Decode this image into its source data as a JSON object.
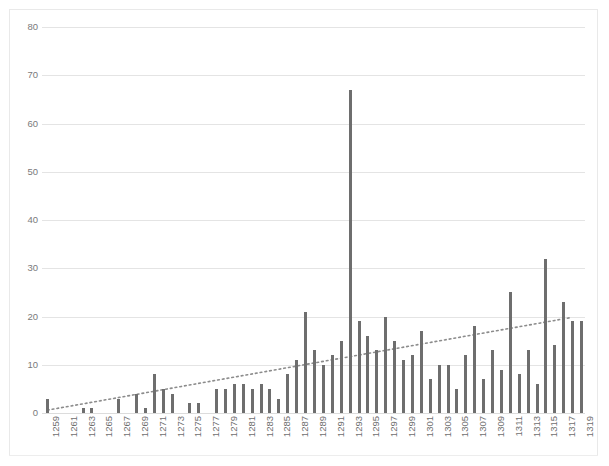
{
  "chart_data": {
    "type": "bar",
    "title": "",
    "subtitle": "",
    "xlabel": "",
    "ylabel": "",
    "ylim": [
      0,
      80
    ],
    "ytick_values": [
      0,
      10,
      20,
      30,
      40,
      50,
      60,
      70,
      80
    ],
    "ytick_labels": [
      "0",
      "10",
      "20",
      "30",
      "40",
      "50",
      "60",
      "70",
      "80"
    ],
    "grid": true,
    "legend": "none",
    "x_tick_interval": 2,
    "categories": [
      "1259",
      "1260",
      "1261",
      "1262",
      "1263",
      "1264",
      "1265",
      "1266",
      "1267",
      "1268",
      "1269",
      "1270",
      "1271",
      "1272",
      "1273",
      "1274",
      "1275",
      "1276",
      "1277",
      "1278",
      "1279",
      "1280",
      "1281",
      "1282",
      "1283",
      "1284",
      "1285",
      "1286",
      "1287",
      "1288",
      "1289",
      "1290",
      "1291",
      "1292",
      "1293",
      "1294",
      "1295",
      "1296",
      "1297",
      "1298",
      "1299",
      "1300",
      "1301",
      "1302",
      "1303",
      "1304",
      "1305",
      "1306",
      "1307",
      "1308",
      "1309",
      "1310",
      "1311",
      "1312",
      "1313",
      "1314",
      "1315",
      "1316",
      "1317",
      "1318",
      "1319"
    ],
    "visible_tick_labels": [
      "1259",
      "1261",
      "1263",
      "1265",
      "1267",
      "1269",
      "1271",
      "1273",
      "1275",
      "1277",
      "1279",
      "1281",
      "1283",
      "1285",
      "1287",
      "1289",
      "1291",
      "1293",
      "1295",
      "1297",
      "1299",
      "1301",
      "1303",
      "1305",
      "1307",
      "1309",
      "1311",
      "1313",
      "1315",
      "1317",
      "1319"
    ],
    "values": [
      3,
      0,
      0,
      0,
      1,
      1,
      0,
      0,
      3,
      0,
      4,
      1,
      8,
      5,
      4,
      0,
      2,
      2,
      0,
      5,
      5,
      6,
      6,
      5,
      6,
      5,
      3,
      8,
      11,
      21,
      13,
      10,
      12,
      15,
      67,
      19,
      16,
      13,
      20,
      15,
      11,
      12,
      17,
      7,
      10,
      10,
      5,
      12,
      18,
      7,
      13,
      9,
      25,
      8,
      13,
      6,
      32,
      14,
      23,
      19,
      19
    ],
    "series_name": "count",
    "bar_color": "#6e6e6e",
    "trendline": {
      "present": true,
      "style": "dotted",
      "color": "#8c8c8c",
      "start_value": 0.6,
      "end_value": 19.8
    },
    "max_value": 67,
    "max_category": "1293"
  },
  "colors": {
    "background": "#ffffff",
    "grid": "#e4e4e4",
    "axis_text": "#7a7a7a",
    "bar": "#6e6e6e",
    "trend": "#8c8c8c",
    "frame": "#e9e9e9"
  }
}
